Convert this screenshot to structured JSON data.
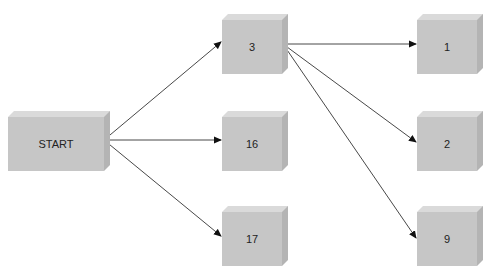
{
  "diagram": {
    "type": "flow-tree",
    "colors": {
      "front": "#c6c6c6",
      "top": "#dadada",
      "side": "#b4b4b4",
      "edge": "#333333",
      "background": "#ffffff"
    },
    "nodes": [
      {
        "id": "start",
        "label": "START",
        "x": 8,
        "y": 111,
        "w": 96,
        "h": 54
      },
      {
        "id": "n3",
        "label": "3",
        "x": 222,
        "y": 14,
        "w": 60,
        "h": 54
      },
      {
        "id": "n16",
        "label": "16",
        "x": 222,
        "y": 111,
        "w": 60,
        "h": 54
      },
      {
        "id": "n17",
        "label": "17",
        "x": 222,
        "y": 206,
        "w": 60,
        "h": 54
      },
      {
        "id": "n1",
        "label": "1",
        "x": 417,
        "y": 14,
        "w": 60,
        "h": 54
      },
      {
        "id": "n2",
        "label": "2",
        "x": 417,
        "y": 111,
        "w": 60,
        "h": 54
      },
      {
        "id": "n9",
        "label": "9",
        "x": 417,
        "y": 206,
        "w": 60,
        "h": 54
      }
    ],
    "edges": [
      {
        "from": "START",
        "to": "3",
        "x1": 104,
        "y1": 140,
        "x2": 221,
        "y2": 42
      },
      {
        "from": "START",
        "to": "16",
        "x1": 104,
        "y1": 140,
        "x2": 221,
        "y2": 140
      },
      {
        "from": "START",
        "to": "17",
        "x1": 104,
        "y1": 140,
        "x2": 221,
        "y2": 236
      },
      {
        "from": "3",
        "to": "1",
        "x1": 283,
        "y1": 44,
        "x2": 416,
        "y2": 44
      },
      {
        "from": "3",
        "to": "2",
        "x1": 283,
        "y1": 44,
        "x2": 416,
        "y2": 142
      },
      {
        "from": "3",
        "to": "9",
        "x1": 283,
        "y1": 44,
        "x2": 416,
        "y2": 238
      }
    ]
  }
}
